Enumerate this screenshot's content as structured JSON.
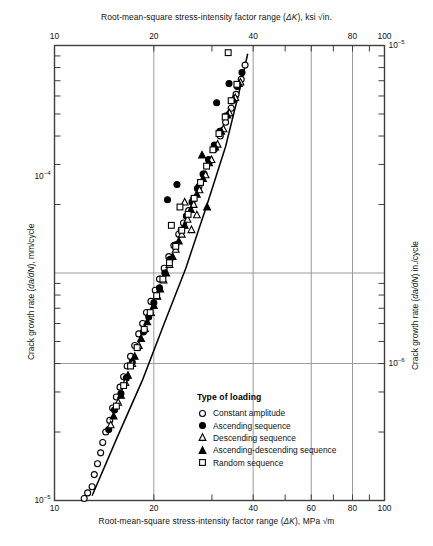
{
  "axes": {
    "top": {
      "title_prefix": "Root-mean-square stress-intensity factor range (",
      "title_symbol": "ΔK",
      "title_suffix": "), ksi √in.",
      "ticks": [
        {
          "label": "10",
          "x": 0.0
        },
        {
          "label": "20",
          "x": 0.301
        },
        {
          "label": "40",
          "x": 0.602
        },
        {
          "label": "80",
          "x": 0.903
        },
        {
          "label": "100",
          "x": 1.0
        }
      ],
      "minor_ticks": [
        0.079,
        0.146,
        0.204,
        0.255,
        0.301,
        0.38,
        0.447,
        0.505,
        0.556,
        0.602,
        0.681,
        0.748,
        0.806,
        0.857,
        0.903,
        0.954,
        1.0
      ]
    },
    "bottom": {
      "title_prefix": "Root-mean-square stress-intensity factor range (",
      "title_symbol": "ΔK",
      "title_suffix": "), MPa √m",
      "ticks": [
        {
          "label": "10",
          "x": 0.0
        },
        {
          "label": "20",
          "x": 0.301
        },
        {
          "label": "40",
          "x": 0.602
        },
        {
          "label": "60",
          "x": 0.778
        },
        {
          "label": "80",
          "x": 0.903
        },
        {
          "label": "100",
          "x": 1.0
        }
      ],
      "gridlines": [
        0.301,
        0.602,
        0.778,
        0.903
      ]
    },
    "left": {
      "title_prefix": "Crack growth rate (",
      "title_symbol": "da/dN",
      "title_suffix": "), mm/cycle",
      "labels": [
        {
          "mantissa": "10",
          "exponent": "–4",
          "y": 0.288
        },
        {
          "mantissa": "10",
          "exponent": "–5",
          "y": 1.0
        }
      ]
    },
    "right": {
      "title_prefix": "Crack growth rate (",
      "title_symbol": "da/dN",
      "title_suffix": ") in./cycle",
      "labels": [
        {
          "mantissa": "10",
          "exponent": "–5",
          "y": 0.0
        },
        {
          "mantissa": "10",
          "exponent": "–6",
          "y": 0.699
        }
      ]
    }
  },
  "legend": {
    "title": "Type of loading",
    "entries": [
      {
        "symbol": "open-circle",
        "label": "Constant amplitude"
      },
      {
        "symbol": "filled-circle",
        "label": "Ascending sequence"
      },
      {
        "symbol": "open-triangle",
        "label": "Descending sequence"
      },
      {
        "symbol": "filled-triangle",
        "label": "Ascending-descending sequence"
      },
      {
        "symbol": "open-square",
        "label": "Random sequence"
      }
    ]
  },
  "style": {
    "frame_color": "#3f3f3f",
    "grid_color": "#9a9a9a",
    "marker_color": "#000000",
    "trend_color": "#000000"
  },
  "chart_data": {
    "type": "scatter",
    "title": "",
    "xlabel": "Root-mean-square stress-intensity factor range (ΔK), MPa √m",
    "ylabel": "Crack growth rate (da/dN), mm/cycle",
    "xscale": "log",
    "yscale": "log",
    "xlim": [
      10,
      100
    ],
    "ylim": [
      1e-05,
      0.001
    ],
    "x_secondary_label": "Root-mean-square stress-intensity factor range (ΔK), ksi √in.",
    "y_secondary_label": "Crack growth rate (da/dN) in./cycle",
    "y_secondary_lim": [
      1e-06,
      0.0001
    ],
    "grid": true,
    "legend_position": "lower-center-right",
    "legend_title": "Type of loading",
    "trend_line": {
      "comment": "power-law best fit band through data",
      "points": [
        [
          13.0,
          1.05e-05
        ],
        [
          15.5,
          1.9e-05
        ],
        [
          18.5,
          3.4e-05
        ],
        [
          21.5,
          6e-05
        ],
        [
          25.0,
          0.000105
        ],
        [
          29.0,
          0.0002
        ],
        [
          33.0,
          0.00036
        ],
        [
          36.5,
          0.00065
        ],
        [
          38.5,
          0.00092
        ]
      ]
    },
    "series": [
      {
        "name": "Constant amplitude",
        "marker": "open-circle",
        "points": [
          [
            12.3,
            1.02e-05
          ],
          [
            12.6,
            1.08e-05
          ],
          [
            13.0,
            1.15e-05
          ],
          [
            13.2,
            1.3e-05
          ],
          [
            13.5,
            1.45e-05
          ],
          [
            13.8,
            1.62e-05
          ],
          [
            14.0,
            1.8e-05
          ],
          [
            14.3,
            2e-05
          ],
          [
            14.7,
            2.25e-05
          ],
          [
            15.0,
            2.55e-05
          ],
          [
            15.4,
            2.85e-05
          ],
          [
            15.8,
            3.15e-05
          ],
          [
            16.2,
            3.5e-05
          ],
          [
            16.6,
            3.9e-05
          ],
          [
            17.0,
            4.3e-05
          ],
          [
            17.5,
            4.8e-05
          ],
          [
            18.0,
            5.4e-05
          ],
          [
            18.5,
            6e-05
          ],
          [
            19.0,
            6.7e-05
          ],
          [
            19.6,
            7.5e-05
          ],
          [
            20.2,
            8.4e-05
          ],
          [
            20.8,
            9.4e-05
          ],
          [
            21.5,
            0.000105
          ],
          [
            22.2,
            0.000118
          ],
          [
            23.0,
            0.000132
          ],
          [
            23.8,
            0.000148
          ],
          [
            24.6,
            0.000166
          ],
          [
            25.5,
            0.000188
          ],
          [
            26.4,
            0.000212
          ],
          [
            27.4,
            0.00024
          ],
          [
            28.4,
            0.000272
          ],
          [
            29.5,
            0.00031
          ],
          [
            30.6,
            0.000352
          ],
          [
            31.8,
            0.0004
          ],
          [
            33.0,
            0.00046
          ],
          [
            34.3,
            0.00053
          ],
          [
            35.5,
            0.00061
          ],
          [
            36.8,
            0.00071
          ],
          [
            37.8,
            0.00082
          ]
        ]
      },
      {
        "name": "Ascending sequence",
        "marker": "filled-circle",
        "points": [
          [
            14.6,
            2.05e-05
          ],
          [
            15.2,
            2.5e-05
          ],
          [
            15.9,
            2.95e-05
          ],
          [
            16.5,
            3.45e-05
          ],
          [
            17.2,
            4.05e-05
          ],
          [
            17.9,
            4.7e-05
          ],
          [
            18.6,
            5.5e-05
          ],
          [
            19.3,
            6.4e-05
          ],
          [
            20.0,
            7.4e-05
          ],
          [
            20.8,
            8.6e-05
          ],
          [
            21.6,
            0.0001
          ],
          [
            22.4,
            0.000115
          ],
          [
            23.3,
            0.000133
          ],
          [
            24.2,
            0.000154
          ],
          [
            25.1,
            0.000178
          ],
          [
            26.1,
            0.000205
          ],
          [
            27.1,
            0.000235
          ],
          [
            28.2,
            0.000272
          ],
          [
            29.3,
            0.000315
          ],
          [
            30.5,
            0.000365
          ],
          [
            31.7,
            0.00042
          ],
          [
            33.0,
            0.00049
          ],
          [
            34.4,
            0.00057
          ],
          [
            35.8,
            0.00066
          ],
          [
            37.0,
            0.00076
          ],
          [
            22.0,
            0.00021
          ],
          [
            23.5,
            0.000245
          ],
          [
            31.0,
            0.00056
          ],
          [
            33.8,
            0.00068
          ]
        ]
      },
      {
        "name": "Descending sequence",
        "marker": "open-triangle",
        "points": [
          [
            14.8,
            2.15e-05
          ],
          [
            15.6,
            2.7e-05
          ],
          [
            16.4,
            3.3e-05
          ],
          [
            17.2,
            4e-05
          ],
          [
            18.0,
            4.8e-05
          ],
          [
            18.8,
            5.7e-05
          ],
          [
            19.6,
            6.7e-05
          ],
          [
            20.5,
            7.9e-05
          ],
          [
            21.4,
            9.3e-05
          ],
          [
            22.3,
            0.000109
          ],
          [
            23.3,
            0.000127
          ],
          [
            24.3,
            0.000148
          ],
          [
            25.3,
            0.000172
          ],
          [
            26.4,
            0.0002
          ],
          [
            27.5,
            0.000232
          ],
          [
            28.7,
            0.00027
          ],
          [
            29.9,
            0.000315
          ],
          [
            31.2,
            0.000368
          ],
          [
            32.5,
            0.00043
          ],
          [
            33.9,
            0.000505
          ],
          [
            35.3,
            0.00059
          ],
          [
            36.6,
            0.00069
          ],
          [
            26.0,
            0.000155
          ],
          [
            27.0,
            0.00018
          ],
          [
            24.8,
            0.000205
          ]
        ]
      },
      {
        "name": "Ascending-descending sequence",
        "marker": "filled-triangle",
        "points": [
          [
            15.1,
            2.35e-05
          ],
          [
            15.9,
            2.9e-05
          ],
          [
            16.7,
            3.55e-05
          ],
          [
            17.5,
            4.3e-05
          ],
          [
            18.3,
            5.15e-05
          ],
          [
            19.1,
            6.1e-05
          ],
          [
            20.0,
            7.2e-05
          ],
          [
            20.9,
            8.5e-05
          ],
          [
            21.8,
            0.0001
          ],
          [
            22.8,
            0.000118
          ],
          [
            23.8,
            0.000138
          ],
          [
            24.8,
            0.000162
          ],
          [
            25.9,
            0.00019
          ],
          [
            27.0,
            0.000222
          ],
          [
            28.2,
            0.00026
          ],
          [
            29.4,
            0.000305
          ],
          [
            30.7,
            0.000358
          ],
          [
            32.0,
            0.00042
          ],
          [
            33.4,
            0.000495
          ],
          [
            34.8,
            0.00058
          ],
          [
            36.2,
            0.00068
          ],
          [
            28.0,
            0.00033
          ],
          [
            29.0,
            0.000195
          ]
        ]
      },
      {
        "name": "Random sequence",
        "marker": "open-square",
        "points": [
          [
            15.4,
            2.6e-05
          ],
          [
            16.2,
            3.2e-05
          ],
          [
            17.0,
            3.9e-05
          ],
          [
            17.8,
            4.7e-05
          ],
          [
            18.7,
            5.65e-05
          ],
          [
            19.5,
            6.7e-05
          ],
          [
            20.4,
            7.95e-05
          ],
          [
            21.3,
            9.4e-05
          ],
          [
            22.3,
            0.000111
          ],
          [
            23.3,
            0.000131
          ],
          [
            24.3,
            0.000154
          ],
          [
            25.4,
            0.000181
          ],
          [
            26.5,
            0.000213
          ],
          [
            27.7,
            0.00025
          ],
          [
            28.9,
            0.000295
          ],
          [
            30.2,
            0.000348
          ],
          [
            31.5,
            0.00041
          ],
          [
            32.9,
            0.000485
          ],
          [
            34.3,
            0.000572
          ],
          [
            35.7,
            0.000675
          ],
          [
            33.6,
            0.00093
          ],
          [
            24.0,
            0.000195
          ],
          [
            22.6,
            0.000162
          ]
        ]
      }
    ]
  }
}
